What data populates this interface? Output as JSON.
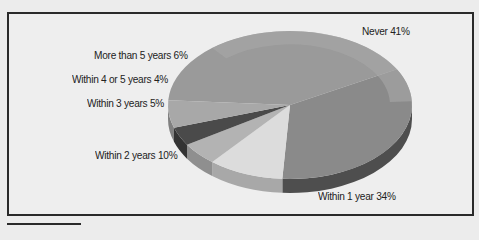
{
  "chart_data": {
    "type": "pie",
    "style": "3d-exploded-tilted",
    "title": "",
    "slices": [
      {
        "label": "Never",
        "value": 41,
        "display": "Never 41%",
        "color": "#9a9a9a",
        "side": "#7d7d7d"
      },
      {
        "label": "Within 1 year",
        "value": 34,
        "display": "Within 1 year 34%",
        "color": "#8a8a8a",
        "side": "#4e4e4e"
      },
      {
        "label": "Within 2 years",
        "value": 10,
        "display": "Within 2 years 10%",
        "color": "#dcdcdc",
        "side": "#a8a8a8"
      },
      {
        "label": "Within 3 years",
        "value": 5,
        "display": "Within 3 years 5%",
        "color": "#b3b3b3",
        "side": "#8f8f8f"
      },
      {
        "label": "Within 4 or 5 years",
        "value": 4,
        "display": "Within 4 or 5 years 4%",
        "color": "#4a4a4a",
        "side": "#333333"
      },
      {
        "label": "More than 5 years",
        "value": 6,
        "display": "More than 5 years 6%",
        "color": "#a8a8a8",
        "side": "#808080"
      }
    ],
    "legend": "none (inline labels)",
    "total": 100
  },
  "labels": {
    "never": "Never 41%",
    "within_1_year": "Within 1 year 34%",
    "within_2_years": "Within 2 years 10%",
    "within_3_years": "Within 3 years 5%",
    "within_4_or_5_years": "Within 4 or 5 years 4%",
    "more_than_5_years": "More than 5 years 6%"
  }
}
